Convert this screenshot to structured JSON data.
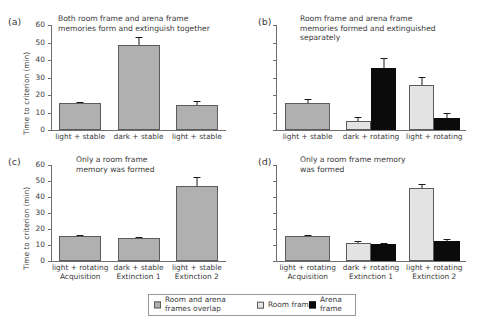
{
  "figure": {
    "ylabel": "Time to criterion (min)",
    "y_ticks": [
      "0",
      "10",
      "20",
      "30",
      "40",
      "50",
      "60"
    ],
    "colors": {
      "overlap": "#b0b0b0",
      "room_frame": "#e3e3e3",
      "arena_frame": "#0b0b0b",
      "axis": "#6e6e6e",
      "text": "#3a3a3a"
    }
  },
  "legend": {
    "items": [
      {
        "label": "Room and arena\nframes overlap",
        "swatch": "overlap-swatch-icon",
        "color": "#b0b0b0"
      },
      {
        "label": "Room frame",
        "swatch": "room-frame-swatch-icon",
        "color": "#e3e3e3"
      },
      {
        "label": "Arena frame",
        "swatch": "arena-frame-swatch-icon",
        "color": "#0b0b0b"
      }
    ]
  },
  "panels": [
    {
      "letter": "(a)",
      "title": "Both room frame and arena frame\nmemories form and extinguish together",
      "show_y_labels": true,
      "ylabel": "Time to criterion (min)"
    },
    {
      "letter": "(b)",
      "title": "Room frame and arena frame\nmemories formed and extinguished\nseparately",
      "show_y_labels": false,
      "ylabel": ""
    },
    {
      "letter": "(c)",
      "title": "Only a room frame\nmemory was formed",
      "show_y_labels": true,
      "ylabel": "Time to criterion (min)"
    },
    {
      "letter": "(d)",
      "title": "Only a room frame memory\nwas formed",
      "show_y_labels": false,
      "ylabel": ""
    }
  ],
  "chart_data": [
    {
      "type": "bar",
      "panel": "(a)",
      "title": "Both room frame and arena frame memories form and extinguish together",
      "xlabel": "",
      "ylabel": "Time to criterion (min)",
      "ylim": [
        0,
        60
      ],
      "yticks": [
        0,
        10,
        20,
        30,
        40,
        50,
        60
      ],
      "grid": false,
      "categories": [
        "light + stable",
        "dark + stable",
        "light + stable"
      ],
      "series": [
        {
          "name": "Room and arena frames overlap",
          "color": "#b0b0b0",
          "values": [
            15.3,
            48.8,
            14.2
          ],
          "errors": [
            0.6,
            4.6,
            2.4
          ]
        }
      ]
    },
    {
      "type": "bar",
      "panel": "(b)",
      "title": "Room frame and arena frame memories formed and extinguished separately",
      "xlabel": "",
      "ylabel": "Time to criterion (min)",
      "ylim": [
        0,
        60
      ],
      "yticks": [
        0,
        10,
        20,
        30,
        40,
        50,
        60
      ],
      "grid": false,
      "categories": [
        "light + stable",
        "dark + rotating",
        "light + rotating"
      ],
      "series": [
        {
          "name": "Room and arena frames overlap",
          "color": "#b0b0b0",
          "values": [
            15.5,
            null,
            null
          ],
          "errors": [
            2.2,
            null,
            null
          ]
        },
        {
          "name": "Room frame",
          "color": "#e3e3e3",
          "values": [
            null,
            5.2,
            25.5
          ],
          "errors": [
            null,
            2.3,
            4.8
          ]
        },
        {
          "name": "Arena frame",
          "color": "#0b0b0b",
          "values": [
            null,
            35.5,
            7.0
          ],
          "errors": [
            null,
            5.5,
            2.6
          ]
        }
      ]
    },
    {
      "type": "bar",
      "panel": "(c)",
      "title": "Only a room frame memory was formed",
      "xlabel": "",
      "ylabel": "Time to criterion (min)",
      "ylim": [
        0,
        60
      ],
      "yticks": [
        0,
        10,
        20,
        30,
        40,
        50,
        60
      ],
      "grid": false,
      "categories": [
        "light + rotating\nAcquisition",
        "dark + stable\nExtinction 1",
        "light + stable\nExtinction 2"
      ],
      "series": [
        {
          "name": "Room and arena frames overlap",
          "color": "#b0b0b0",
          "values": [
            15.4,
            14.6,
            46.8
          ],
          "errors": [
            0.6,
            0.4,
            5.8
          ]
        }
      ]
    },
    {
      "type": "bar",
      "panel": "(d)",
      "title": "Only a room frame memory was formed",
      "xlabel": "",
      "ylabel": "Time to criterion (min)",
      "ylim": [
        0,
        60
      ],
      "yticks": [
        0,
        10,
        20,
        30,
        40,
        50,
        60
      ],
      "grid": false,
      "categories": [
        "light + rotating\nAcquisition",
        "dark + rotating\nExtinction 1",
        "light + rotating\nExtinction 2"
      ],
      "series": [
        {
          "name": "Room and arena frames overlap",
          "color": "#b0b0b0",
          "values": [
            15.5,
            null,
            null
          ],
          "errors": [
            0.8,
            null,
            null
          ]
        },
        {
          "name": "Room frame",
          "color": "#e3e3e3",
          "values": [
            null,
            11.5,
            45.8
          ],
          "errors": [
            null,
            0.9,
            2.3
          ]
        },
        {
          "name": "Arena frame",
          "color": "#0b0b0b",
          "values": [
            null,
            10.5,
            12.5
          ],
          "errors": [
            null,
            0.7,
            1.0
          ]
        }
      ]
    }
  ]
}
